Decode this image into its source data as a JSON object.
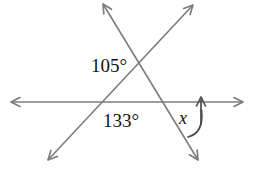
{
  "figure": {
    "kind": "geometry-angle-diagram",
    "background_color": "#ffffff",
    "line_color": "#7c7c7c",
    "text_color": "#111111",
    "stroke_width": 1.6,
    "canvas": {
      "width": 253,
      "height": 172
    }
  },
  "lines": {
    "horizontal": {
      "name": "horizontal-line",
      "x1": 11,
      "y1": 102,
      "x2": 243,
      "y2": 102,
      "arrow_start": true,
      "arrow_end": true
    },
    "rising_diagonal": {
      "name": "rising-diagonal-line",
      "x1": 48,
      "y1": 160,
      "x2": 193,
      "y2": 5,
      "arrow_start": true,
      "arrow_end": true
    },
    "falling_diagonal": {
      "name": "falling-diagonal-line",
      "x1": 103,
      "y1": 4,
      "x2": 198,
      "y2": 160,
      "arrow_start": true,
      "arrow_end": true
    }
  },
  "intersections": {
    "diagonal_cross": {
      "x": 143,
      "y": 63
    },
    "left_on_horizontal": {
      "x": 102,
      "y": 102
    },
    "right_on_horizontal": {
      "x": 168,
      "y": 102
    }
  },
  "labels": {
    "angle_top": {
      "text": "105°",
      "value": 105,
      "unit": "degrees",
      "x": 91,
      "y": 72
    },
    "angle_lower": {
      "text": "133°",
      "value": 133,
      "unit": "degrees",
      "x": 103,
      "y": 127
    },
    "unknown_angle": {
      "text": "x",
      "x": 179,
      "y": 124
    }
  },
  "angle_marker": {
    "name": "angle-arc-x",
    "arc_path": "M 188 137 Q 203 132 201 108",
    "vertical_arrow": {
      "x": 201,
      "y_tip": 95,
      "y_base": 125
    }
  }
}
